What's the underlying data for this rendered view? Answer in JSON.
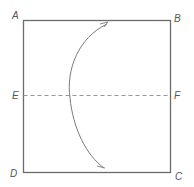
{
  "diagram": {
    "type": "geometry-square-with-arc",
    "labels": {
      "A": "A",
      "B": "B",
      "C": "C",
      "D": "D",
      "E": "E",
      "F": "F"
    },
    "colors": {
      "square_stroke": "#6b6b6b",
      "dashed_line": "#8a8a8a",
      "arc_stroke": "#7a7a7a",
      "label": "#555555"
    },
    "elements": {
      "square": "ABCD",
      "dashed_line": "EF",
      "arc": "curve bulging toward AD, tangent to EF region"
    }
  }
}
